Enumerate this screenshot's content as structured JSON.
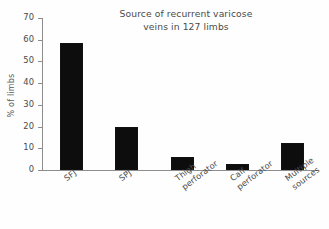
{
  "chart_data": {
    "type": "bar",
    "title": "Source of recurrent varicose\nveins in 127 limbs",
    "title_line1": "Source of recurrent varicose",
    "title_line2": "veins in 127 limbs",
    "xlabel": "",
    "ylabel": "% of limbs",
    "categories": [
      "SFJ",
      "SPJ",
      "Thigh perforator",
      "Calf perforator",
      "Multiple sources"
    ],
    "category_lines": [
      [
        "SFJ"
      ],
      [
        "SPJ"
      ],
      [
        "Thigh",
        "perforator"
      ],
      [
        "Calf",
        "perforator"
      ],
      [
        "Multiple",
        "sources"
      ]
    ],
    "values": [
      58.5,
      19.8,
      6.0,
      2.8,
      12.5
    ],
    "ylim": [
      0,
      70
    ],
    "yticks": [
      0,
      10,
      20,
      30,
      40,
      50,
      60,
      70
    ],
    "ytick_labels": [
      "0",
      "10",
      "20",
      "30",
      "40",
      "50",
      "60",
      "70"
    ],
    "grid": false,
    "legend": null,
    "bar_color": "#0d0d0d",
    "axis_color": "#8d8d8d",
    "background_color": "#fefefe",
    "n_limbs": 127
  }
}
